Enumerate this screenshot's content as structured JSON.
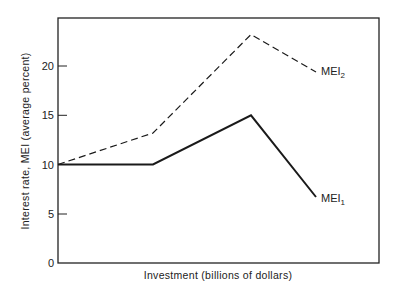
{
  "chart_data": {
    "type": "line",
    "title": "",
    "xlabel": "Investment (billions of dollars)",
    "ylabel": "Interest rate, MEI (average percent)",
    "ylim": [
      0,
      25
    ],
    "yticks": [
      0,
      5,
      10,
      15,
      20
    ],
    "xticks": [],
    "grid": false,
    "legend": "inline labels at line ends",
    "x": [
      0,
      1,
      2,
      2.66
    ],
    "series": [
      {
        "name": "MEI",
        "subscript": "1",
        "style": "solid",
        "values": [
          10,
          10,
          15,
          6.7
        ]
      },
      {
        "name": "MEI",
        "subscript": "2",
        "style": "dashed",
        "values": [
          10,
          13.2,
          23.2,
          19.4
        ]
      }
    ]
  },
  "layout": {
    "frame": {
      "left": 58,
      "top": 18,
      "right": 379,
      "bottom": 263
    },
    "x_pixels": [
      58,
      153,
      251,
      316
    ],
    "y_zero_px": 263,
    "px_per_unit": 9.85
  },
  "labels": {
    "ylabel": "Interest rate, MEI (average percent)",
    "xlabel": "Investment (billions of dollars)",
    "tick_0": "0",
    "tick_5": "5",
    "tick_10": "10",
    "tick_15": "15",
    "tick_20": "20",
    "mei1_base": "MEI",
    "mei1_sub": "1",
    "mei2_base": "MEI",
    "mei2_sub": "2"
  },
  "colors": {
    "line": "#1a1a1a",
    "background": "#ffffff"
  }
}
